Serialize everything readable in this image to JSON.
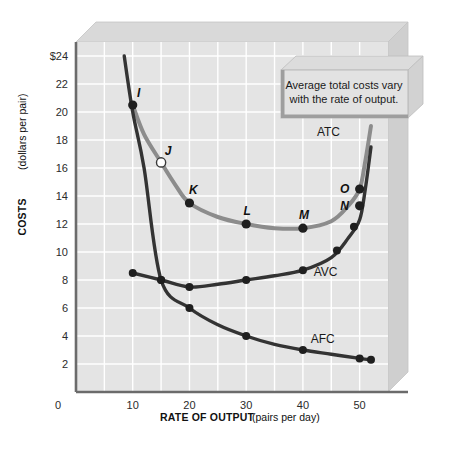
{
  "figure": {
    "callout": {
      "line1": "Average total costs vary",
      "line2": "with the rate of output."
    },
    "colors": {
      "plot_background": "#e4e4e4",
      "gridline": "#ffffff",
      "axis": "#6b6b6b",
      "atc_curve": "#8c8c8c",
      "avc_curve": "#333333",
      "afc_curve": "#333333",
      "bevel_top": "#d8d8d8",
      "bevel_side": "#cfcfcf",
      "callout_fill": "#e0e0e0"
    }
  },
  "chart_data": {
    "type": "line",
    "title": "",
    "xlabel_bold": "RATE OF OUTPUT",
    "xlabel_normal": "(pairs per day)",
    "ylabel_bold": "COSTS",
    "ylabel_normal": "(dollars per pair)",
    "xlim": [
      0,
      55
    ],
    "ylim": [
      0,
      25
    ],
    "x_ticks": [
      0,
      10,
      20,
      30,
      40,
      50
    ],
    "x_tick_labels": [
      "0",
      "10",
      "20",
      "30",
      "40",
      "50"
    ],
    "y_ticks": [
      2,
      4,
      6,
      8,
      10,
      12,
      14,
      16,
      18,
      20,
      22,
      24
    ],
    "y_tick_labels": [
      "2",
      "4",
      "6",
      "8",
      "10",
      "12",
      "14",
      "16",
      "18",
      "20",
      "22",
      "24"
    ],
    "y_tick_top_label": "$24",
    "grid": true,
    "legend_position": "inline-labels",
    "series": [
      {
        "name": "ATC",
        "label": "ATC",
        "color": "#8c8c8c",
        "x": [
          10,
          12,
          15,
          17.5,
          20,
          25,
          30,
          35,
          40,
          45,
          48,
          50,
          51,
          52
        ],
        "values": [
          20.5,
          18.4,
          16.4,
          14.8,
          13.5,
          12.5,
          12.0,
          11.7,
          11.7,
          12.2,
          13.3,
          14.5,
          16.5,
          19.0
        ]
      },
      {
        "name": "AVC",
        "label": "AVC",
        "color": "#333333",
        "x": [
          10,
          15,
          20,
          25,
          30,
          35,
          40,
          45,
          48,
          50,
          51,
          52
        ],
        "values": [
          8.5,
          8.0,
          7.5,
          7.7,
          8.0,
          8.3,
          8.7,
          9.6,
          11.0,
          12.3,
          14.5,
          17.5
        ]
      },
      {
        "name": "AFC",
        "label": "AFC",
        "color": "#333333",
        "x": [
          8.5,
          10,
          12,
          15,
          20,
          25,
          30,
          35,
          40,
          45,
          50,
          52
        ],
        "values": [
          24.0,
          20.0,
          16.0,
          8.0,
          6.0,
          4.8,
          4.0,
          3.4,
          3.0,
          2.7,
          2.4,
          2.3
        ]
      }
    ],
    "labeled_points": [
      {
        "label": "I",
        "x": 10,
        "y": 20.5,
        "series": "ATC",
        "filled": true,
        "label_dx": 6,
        "label_dy": -8
      },
      {
        "label": "J",
        "x": 15,
        "y": 16.4,
        "series": "ATC",
        "filled": false,
        "label_dx": 7,
        "label_dy": -7
      },
      {
        "label": "K",
        "x": 20,
        "y": 13.5,
        "series": "ATC",
        "filled": true,
        "label_dx": 4,
        "label_dy": -9
      },
      {
        "label": "L",
        "x": 30,
        "y": 12.0,
        "series": "ATC",
        "filled": true,
        "label_dx": 1,
        "label_dy": -9
      },
      {
        "label": "M",
        "x": 40,
        "y": 11.7,
        "series": "ATC",
        "filled": true,
        "label_dx": 1,
        "label_dy": -9
      },
      {
        "label": "N",
        "x": 50,
        "y": 13.3,
        "series": "ATC",
        "filled": true,
        "label_dx": -15,
        "label_dy": 4
      },
      {
        "label": "O",
        "x": 50,
        "y": 14.5,
        "series": "ATC",
        "filled": true,
        "label_dx": -15,
        "label_dy": 4
      }
    ],
    "plain_points": [
      {
        "x": 10,
        "y": 8.5,
        "series": "AVC"
      },
      {
        "x": 15,
        "y": 8.0,
        "series": "AVC"
      },
      {
        "x": 20,
        "y": 7.5,
        "series": "AVC"
      },
      {
        "x": 30,
        "y": 8.0,
        "series": "AVC"
      },
      {
        "x": 40,
        "y": 8.7,
        "series": "AVC"
      },
      {
        "x": 46,
        "y": 10.1,
        "series": "AVC"
      },
      {
        "x": 49,
        "y": 11.8,
        "series": "AVC"
      },
      {
        "x": 15,
        "y": 8.0,
        "series": "AFC"
      },
      {
        "x": 20,
        "y": 6.0,
        "series": "AFC"
      },
      {
        "x": 30,
        "y": 4.0,
        "series": "AFC"
      },
      {
        "x": 40,
        "y": 3.0,
        "series": "AFC"
      },
      {
        "x": 50,
        "y": 2.4,
        "series": "AFC"
      },
      {
        "x": 52,
        "y": 2.3,
        "series": "AFC"
      }
    ],
    "curve_labels": [
      {
        "text": "ATC",
        "x": 44.5,
        "y": 18.3
      },
      {
        "text": "AVC",
        "x": 44.0,
        "y": 8.3
      },
      {
        "text": "AFC",
        "x": 43.5,
        "y": 3.5
      }
    ]
  }
}
